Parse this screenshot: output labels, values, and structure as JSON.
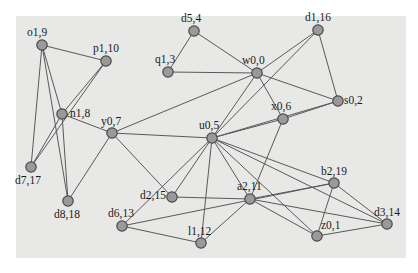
{
  "figure": {
    "kind": "node-link-graph",
    "background_color": "#ffffff",
    "plate_color": "#e8e8e6",
    "node_fill": "#9a9a9a",
    "node_stroke": "#4a4a4c",
    "edge_color": "#59595b",
    "label_color": "#1b1b1b",
    "plate": {
      "x": 16,
      "y": 16,
      "width": 390,
      "height": 242
    },
    "node_radius": 5.2
  },
  "graph": {
    "node_count": 20,
    "edge_count": 41,
    "nodes": [
      {
        "id": "o1",
        "label": "o1,9",
        "cx": 42,
        "cy": 45,
        "lx": 27,
        "ly": 36
      },
      {
        "id": "p1",
        "label": "p1,10",
        "cx": 106,
        "cy": 61,
        "lx": 93,
        "ly": 52
      },
      {
        "id": "n1",
        "label": "n1,8",
        "cx": 62,
        "cy": 114,
        "lx": 70,
        "ly": 117
      },
      {
        "id": "y0",
        "label": "y0,7",
        "cx": 112,
        "cy": 133,
        "lx": 101,
        "ly": 125
      },
      {
        "id": "d7",
        "label": "d7,17",
        "cx": 31,
        "cy": 167,
        "lx": 15,
        "ly": 184
      },
      {
        "id": "d8",
        "label": "d8,18",
        "cx": 68,
        "cy": 201,
        "lx": 54,
        "ly": 218
      },
      {
        "id": "d5",
        "label": "d5,4",
        "cx": 194,
        "cy": 31,
        "lx": 181,
        "ly": 22
      },
      {
        "id": "q1",
        "label": "q1,3",
        "cx": 168,
        "cy": 72,
        "lx": 155,
        "ly": 63
      },
      {
        "id": "w0",
        "label": "w0,0",
        "cx": 257,
        "cy": 73,
        "lx": 242,
        "ly": 64
      },
      {
        "id": "d1",
        "label": "d1,16",
        "cx": 318,
        "cy": 30,
        "lx": 305,
        "ly": 21
      },
      {
        "id": "s0",
        "label": "s0,2",
        "cx": 338,
        "cy": 101,
        "lx": 344,
        "ly": 104
      },
      {
        "id": "x0",
        "label": "x0,6",
        "cx": 283,
        "cy": 119,
        "lx": 271,
        "ly": 110
      },
      {
        "id": "u0",
        "label": "u0,5",
        "cx": 212,
        "cy": 138,
        "lx": 199,
        "ly": 129
      },
      {
        "id": "d2",
        "label": "d2,15",
        "cx": 172,
        "cy": 197,
        "lx": 140,
        "ly": 199
      },
      {
        "id": "a2",
        "label": "a2,11",
        "cx": 250,
        "cy": 199,
        "lx": 237,
        "ly": 190
      },
      {
        "id": "b2",
        "label": "b2,19",
        "cx": 334,
        "cy": 183,
        "lx": 321,
        "ly": 175
      },
      {
        "id": "z0",
        "label": "z0,1",
        "cx": 317,
        "cy": 236,
        "lx": 321,
        "ly": 229
      },
      {
        "id": "d3",
        "label": "d3,14",
        "cx": 387,
        "cy": 224,
        "lx": 374,
        "ly": 216
      },
      {
        "id": "d6",
        "label": "d6,13",
        "cx": 122,
        "cy": 226,
        "lx": 108,
        "ly": 217
      },
      {
        "id": "l1",
        "label": "l1,12",
        "cx": 201,
        "cy": 243,
        "lx": 188,
        "ly": 235
      }
    ],
    "edges": [
      [
        "o1",
        "p1"
      ],
      [
        "o1",
        "n1"
      ],
      [
        "o1",
        "d7"
      ],
      [
        "o1",
        "d8"
      ],
      [
        "p1",
        "n1"
      ],
      [
        "p1",
        "d7"
      ],
      [
        "n1",
        "y0"
      ],
      [
        "n1",
        "d7"
      ],
      [
        "n1",
        "d8"
      ],
      [
        "y0",
        "u0"
      ],
      [
        "y0",
        "w0"
      ],
      [
        "y0",
        "d2"
      ],
      [
        "y0",
        "d8"
      ],
      [
        "q1",
        "d5"
      ],
      [
        "q1",
        "w0"
      ],
      [
        "d5",
        "w0"
      ],
      [
        "w0",
        "d1"
      ],
      [
        "w0",
        "s0"
      ],
      [
        "w0",
        "u0"
      ],
      [
        "w0",
        "x0"
      ],
      [
        "d1",
        "s0"
      ],
      [
        "d1",
        "u0"
      ],
      [
        "s0",
        "x0"
      ],
      [
        "s0",
        "u0"
      ],
      [
        "x0",
        "u0"
      ],
      [
        "x0",
        "a2"
      ],
      [
        "u0",
        "d2"
      ],
      [
        "u0",
        "a2"
      ],
      [
        "u0",
        "b2"
      ],
      [
        "u0",
        "z0"
      ],
      [
        "u0",
        "d3"
      ],
      [
        "u0",
        "l1"
      ],
      [
        "u0",
        "d6"
      ],
      [
        "d2",
        "a2"
      ],
      [
        "a2",
        "b2"
      ],
      [
        "a2",
        "z0"
      ],
      [
        "a2",
        "d3"
      ],
      [
        "a2",
        "l1"
      ],
      [
        "b2",
        "z0"
      ],
      [
        "b2",
        "d3"
      ],
      [
        "z0",
        "d3"
      ],
      [
        "d6",
        "l1"
      ],
      [
        "d6",
        "b2"
      ]
    ]
  }
}
